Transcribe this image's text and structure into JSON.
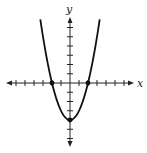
{
  "chart_data": {
    "type": "line",
    "title": "",
    "function": "y = x^2 - 4",
    "xlabel": "x",
    "ylabel": "y",
    "xlim": [
      -7,
      7
    ],
    "ylim": [
      -7,
      7
    ],
    "grid": false,
    "x_ticks": [
      -6,
      -5,
      -4,
      -3,
      -2,
      -1,
      1,
      2,
      3,
      4,
      5,
      6
    ],
    "y_ticks": [
      -6,
      -5,
      -4,
      -3,
      -2,
      -1,
      1,
      2,
      3,
      4,
      5,
      6
    ],
    "tick_labels_shown": false,
    "series": [
      {
        "name": "parabola",
        "x": [
          -3.3,
          -3,
          -2.5,
          -2,
          -1.5,
          -1,
          -0.5,
          0,
          0.5,
          1,
          1.5,
          2,
          2.5,
          3,
          3.3
        ],
        "y": [
          6.89,
          5,
          2.25,
          0,
          -1.75,
          -3,
          -3.75,
          -4,
          -3.75,
          -3,
          -1.75,
          0,
          2.25,
          5,
          6.89
        ]
      }
    ],
    "highlighted_points": [
      {
        "label": "x-intercept-left",
        "x": -2,
        "y": 0
      },
      {
        "label": "x-intercept-right",
        "x": 2,
        "y": 0
      },
      {
        "label": "vertex",
        "x": 0,
        "y": -4
      }
    ],
    "colors": {
      "axis": "#222222",
      "curve": "#111111",
      "background": "#ffffff"
    }
  },
  "labels": {
    "x_axis": "x",
    "y_axis": "y"
  }
}
